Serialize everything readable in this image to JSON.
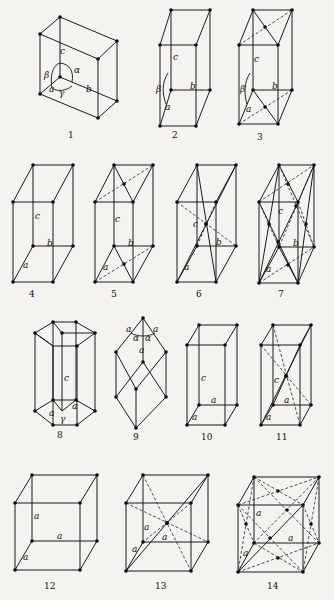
{
  "figure": {
    "colors": {
      "background": "#f4f3ef",
      "ink": "#111111"
    },
    "lattices": [
      {
        "number": "1",
        "labels": {
          "c": "c",
          "b": "b",
          "a": "a",
          "alpha": "α",
          "beta": "β",
          "gamma": "γ"
        }
      },
      {
        "number": "2",
        "labels": {
          "c": "c",
          "b": "b",
          "a": "a",
          "beta": "β"
        }
      },
      {
        "number": "3",
        "labels": {
          "c": "c",
          "b": "b",
          "a": "a",
          "beta": "β"
        }
      },
      {
        "number": "4",
        "labels": {
          "c": "c",
          "b": "b",
          "a": "a"
        }
      },
      {
        "number": "5",
        "labels": {
          "c": "c",
          "b": "b",
          "a": "a"
        }
      },
      {
        "number": "6",
        "labels": {
          "c": "c",
          "b": "b",
          "a": "a"
        }
      },
      {
        "number": "7",
        "labels": {
          "c": "c",
          "b": "b",
          "a": "a"
        }
      },
      {
        "number": "8",
        "labels": {
          "c": "c",
          "a1": "a",
          "a2": "a",
          "gamma": "γ"
        }
      },
      {
        "number": "9",
        "labels": {
          "a1": "a",
          "a2": "a",
          "a3": "a",
          "alpha1": "α",
          "alpha2": "α"
        }
      },
      {
        "number": "10",
        "labels": {
          "c": "c",
          "a1": "a",
          "a2": "a"
        }
      },
      {
        "number": "11",
        "labels": {
          "c": "c",
          "a1": "a",
          "a2": "a"
        }
      },
      {
        "number": "12",
        "labels": {
          "a1": "a",
          "a2": "a",
          "a3": "a"
        }
      },
      {
        "number": "13",
        "labels": {
          "a1": "a",
          "a2": "a",
          "a3": "a"
        }
      },
      {
        "number": "14",
        "labels": {
          "a1": "a",
          "a2": "a",
          "a3": "a"
        }
      }
    ]
  }
}
